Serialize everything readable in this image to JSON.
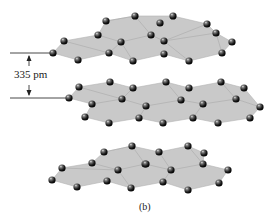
{
  "figure": {
    "spacing_label": "335 pm",
    "caption": "(b)"
  },
  "colors": {
    "plate": "#c9c9c9",
    "atom": "#1a1a1a",
    "background": "#ffffff"
  },
  "layers": [
    {
      "name": "top",
      "atoms": [
        [
          53,
          53
        ],
        [
          64,
          41
        ],
        [
          78,
          60
        ],
        [
          98,
          35
        ],
        [
          106,
          21
        ],
        [
          109,
          53
        ],
        [
          121,
          42
        ],
        [
          135,
          16
        ],
        [
          133,
          61
        ],
        [
          151,
          35
        ],
        [
          160,
          23
        ],
        [
          164,
          41
        ],
        [
          164,
          54
        ],
        [
          173,
          16
        ],
        [
          189,
          61
        ],
        [
          207,
          24
        ],
        [
          216,
          33
        ],
        [
          222,
          53
        ],
        [
          232,
          42
        ]
      ]
    },
    {
      "name": "middle",
      "atoms": [
        [
          69,
          98
        ],
        [
          79,
          87
        ],
        [
          92,
          104
        ],
        [
          85,
          117
        ],
        [
          110,
          82
        ],
        [
          109,
          123
        ],
        [
          122,
          99
        ],
        [
          133,
          88
        ],
        [
          139,
          118
        ],
        [
          146,
          106
        ],
        [
          166,
          82
        ],
        [
          163,
          123
        ],
        [
          181,
          100
        ],
        [
          189,
          88
        ],
        [
          193,
          118
        ],
        [
          203,
          104
        ],
        [
          218,
          123
        ],
        [
          221,
          82
        ],
        [
          236,
          99
        ],
        [
          244,
          88
        ],
        [
          250,
          118
        ],
        [
          260,
          107
        ]
      ]
    },
    {
      "name": "bottom",
      "atoms": [
        [
          52,
          180
        ],
        [
          62,
          168
        ],
        [
          77,
          187
        ],
        [
          92,
          163
        ],
        [
          104,
          152
        ],
        [
          107,
          181
        ],
        [
          118,
          170
        ],
        [
          132,
          146
        ],
        [
          131,
          188
        ],
        [
          145,
          164
        ],
        [
          146,
          164
        ],
        [
          159,
          152
        ],
        [
          163,
          182
        ],
        [
          171,
          170
        ],
        [
          188,
          146
        ],
        [
          188,
          190
        ],
        [
          203,
          164
        ],
        [
          204,
          153
        ],
        [
          219,
          183
        ],
        [
          228,
          170
        ]
      ]
    }
  ]
}
